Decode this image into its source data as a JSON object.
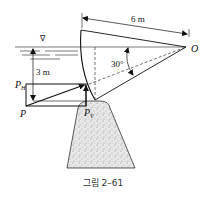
{
  "figure": {
    "caption": "그림 2–61",
    "labels": {
      "length": "6 m",
      "depth": "3 m",
      "angle": "30°",
      "pivot": "O",
      "resultant": "P",
      "horizontal_component_main": "P",
      "horizontal_component_sub": "H",
      "vertical_component_main": "P",
      "vertical_component_sub": "V",
      "water_surface_symbol": "∇"
    }
  }
}
